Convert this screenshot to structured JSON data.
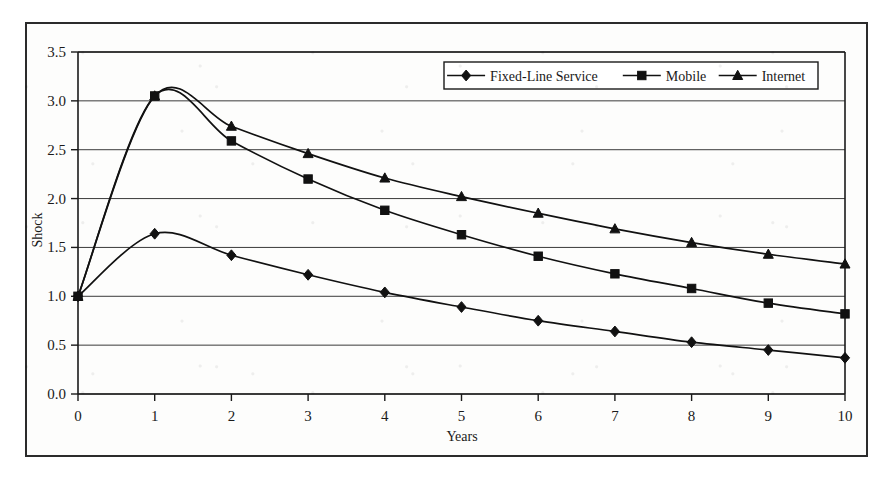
{
  "chart_data": {
    "type": "line",
    "title": "",
    "xlabel": "Years",
    "ylabel": "Shock",
    "x": [
      0,
      1,
      2,
      3,
      4,
      5,
      6,
      7,
      8,
      9,
      10
    ],
    "xtick_labels": [
      "0",
      "1",
      "2",
      "3",
      "4",
      "5",
      "6",
      "7",
      "8",
      "9",
      "10"
    ],
    "ytick_labels": [
      "0.0",
      "0.5",
      "1.0",
      "1.5",
      "2.0",
      "2.5",
      "3.0",
      "3.5"
    ],
    "ytick_values": [
      0.0,
      0.5,
      1.0,
      1.5,
      2.0,
      2.5,
      3.0,
      3.5
    ],
    "xlim": [
      0,
      10
    ],
    "ylim": [
      0.0,
      3.5
    ],
    "grid": "horizontal",
    "smoothed": true,
    "legend_position": "top-right",
    "series": [
      {
        "name": "Fixed-Line Service",
        "marker": "diamond",
        "values": [
          1.0,
          1.64,
          1.42,
          1.22,
          1.04,
          0.89,
          0.75,
          0.64,
          0.53,
          0.45,
          0.37
        ]
      },
      {
        "name": "Mobile",
        "marker": "square",
        "values": [
          1.0,
          3.05,
          2.59,
          2.2,
          1.88,
          1.63,
          1.41,
          1.23,
          1.08,
          0.93,
          0.82
        ]
      },
      {
        "name": "Internet",
        "marker": "triangle",
        "values": [
          1.0,
          3.05,
          2.74,
          2.46,
          2.21,
          2.02,
          1.85,
          1.69,
          1.55,
          1.43,
          1.33
        ]
      }
    ],
    "colors": {
      "line": "#111111",
      "marker": "#111111",
      "grid": "#3a3a3a",
      "axis": "#1a1a1a",
      "background": "#fdfdfc",
      "frame": "#2b2b2b"
    }
  },
  "legend": {
    "items": [
      {
        "label": "Fixed-Line Service",
        "marker": "diamond"
      },
      {
        "label": "Mobile",
        "marker": "square"
      },
      {
        "label": "Internet",
        "marker": "triangle"
      }
    ]
  },
  "axes": {
    "y_title": "Shock",
    "x_title": "Years"
  }
}
